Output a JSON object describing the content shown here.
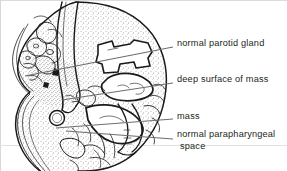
{
  "figure": {
    "kind": "anatomical-line-drawing",
    "view": "axial cross-section of head and neck showing parotid region mass",
    "background_color": "#ffffff",
    "ink_color": "#1a1a1a",
    "stipple_color": "#3a3a3a",
    "leader_line_color": "#6e6e6e"
  },
  "labels": [
    {
      "id": "normal-parotid-gland",
      "text": "normal parotid gland",
      "text_x": 177,
      "text_y": 38,
      "leader": {
        "x1": 173,
        "y1": 47,
        "x2": 25,
        "y2": 76
      }
    },
    {
      "id": "deep-surface-of-mass",
      "text": "deep surface of mass",
      "text_x": 177,
      "text_y": 74,
      "leader": {
        "x1": 173,
        "y1": 83,
        "x2": 62,
        "y2": 100
      }
    },
    {
      "id": "mass",
      "text": "mass",
      "text_x": 177,
      "text_y": 111,
      "leader": {
        "x1": 173,
        "y1": 119,
        "x2": 56,
        "y2": 128
      }
    },
    {
      "id": "normal-parapharyngeal-space",
      "text": "normal parapharyngeal",
      "text_second_line": "space",
      "text_x": 177,
      "text_y": 129,
      "leader": {
        "x1": 173,
        "y1": 139,
        "x2": 66,
        "y2": 131
      }
    }
  ]
}
